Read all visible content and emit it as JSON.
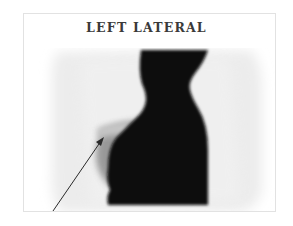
{
  "figure": {
    "title": "LEFT LATERAL",
    "view": "left lateral scintigram",
    "annotation": {
      "type": "arrow",
      "description": "arrow pointing to focal uptake region"
    }
  },
  "colors": {
    "background": "#ffffff",
    "frame_border": "#e2e2e2",
    "uptake_dark": "#0c0c0c",
    "halo_gray": "#e9e9e9",
    "arrow": "#2a2a2a",
    "title": "#3a3a3a"
  }
}
